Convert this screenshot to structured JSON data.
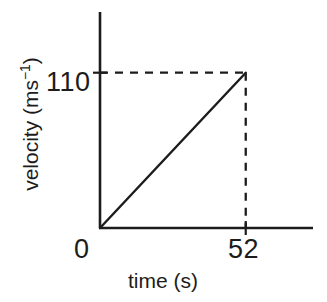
{
  "figure": {
    "background_color": "#ffffff",
    "ink_color": "#1c1c1c",
    "width": 327,
    "height": 302
  },
  "axes": {
    "x_title": "time (s)",
    "y_title_base": "velocity (ms",
    "y_title_sup": "−1",
    "y_title_close": ")",
    "x_tick_origin": "0",
    "x_tick_end": "52",
    "y_tick_end": "110"
  },
  "chart_data": {
    "type": "line",
    "title": "",
    "xlabel": "time (s)",
    "ylabel": "velocity (ms−1)",
    "xlim": [
      0,
      76
    ],
    "ylim": [
      0,
      153
    ],
    "grid": false,
    "legend": null,
    "x_ticks": [
      0,
      52
    ],
    "x_tick_labels": [
      "0",
      "52"
    ],
    "y_ticks": [
      110
    ],
    "y_tick_labels": [
      "110"
    ],
    "series": [
      {
        "name": "velocity",
        "style": "solid",
        "x": [
          0,
          52
        ],
        "values": [
          0,
          110
        ]
      }
    ],
    "annotations": [
      {
        "name": "horizontal-guide",
        "style": "dashed",
        "from": [
          0,
          110
        ],
        "to": [
          52,
          110
        ]
      },
      {
        "name": "vertical-guide",
        "style": "dashed",
        "from": [
          52,
          110
        ],
        "to": [
          52,
          0
        ]
      }
    ]
  }
}
